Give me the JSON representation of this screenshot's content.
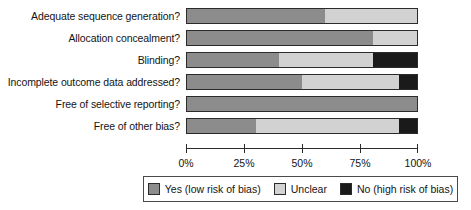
{
  "chart_data": {
    "type": "bar",
    "subtype": "horizontal-stacked-percent",
    "title": "",
    "subtitle": "",
    "xlabel": "",
    "ylabel": "",
    "xlim": [
      0,
      100
    ],
    "x_tick_labels": [
      "0%",
      "25%",
      "50%",
      "75%",
      "100%"
    ],
    "x_tick_values": [
      0,
      25,
      50,
      75,
      100
    ],
    "grid": false,
    "legend_position": "bottom",
    "categories": [
      "Adequate sequence generation?",
      "Allocation concealment?",
      "Blinding?",
      "Incomplete outcome data addressed?",
      "Free of selective reporting?",
      "Free of other bias?"
    ],
    "series": [
      {
        "name": "Yes (low risk of bias)",
        "color": "#8c8c8c",
        "values": [
          60,
          81,
          40,
          50,
          100,
          30
        ]
      },
      {
        "name": "Unclear",
        "color": "#d2d2d2",
        "values": [
          40,
          19,
          41,
          42,
          0,
          62
        ]
      },
      {
        "name": "No (high risk of bias)",
        "color": "#1a1a1a",
        "values": [
          0,
          0,
          19,
          8,
          0,
          8
        ]
      }
    ]
  },
  "rows": [
    {
      "label": "Adequate sequence generation?",
      "yes": 60,
      "unclear": 40,
      "no": 0
    },
    {
      "label": "Allocation concealment?",
      "yes": 81,
      "unclear": 19,
      "no": 0
    },
    {
      "label": "Blinding?",
      "yes": 40,
      "unclear": 41,
      "no": 19
    },
    {
      "label": "Incomplete outcome data addressed?",
      "yes": 50,
      "unclear": 42,
      "no": 8
    },
    {
      "label": "Free of selective reporting?",
      "yes": 100,
      "unclear": 0,
      "no": 0
    },
    {
      "label": "Free of other bias?",
      "yes": 30,
      "unclear": 62,
      "no": 8
    }
  ],
  "axis": {
    "ticks": [
      {
        "label": "0%",
        "value": 0
      },
      {
        "label": "25%",
        "value": 25
      },
      {
        "label": "50%",
        "value": 50
      },
      {
        "label": "75%",
        "value": 75
      },
      {
        "label": "100%",
        "value": 100
      }
    ]
  },
  "legend": {
    "entries": [
      {
        "label": "Yes (low risk of bias)",
        "color": "#8c8c8c"
      },
      {
        "label": "Unclear",
        "color": "#d2d2d2"
      },
      {
        "label": "No (high risk of bias)",
        "color": "#1a1a1a"
      }
    ]
  }
}
